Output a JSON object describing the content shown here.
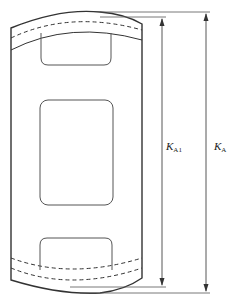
{
  "diagram": {
    "type": "technical-drawing",
    "stroke_color": "#333333",
    "dimensions": [
      {
        "id": "KA1",
        "symbol": "K",
        "subscript": "A1"
      },
      {
        "id": "KA",
        "symbol": "K",
        "subscript": "A"
      }
    ]
  }
}
